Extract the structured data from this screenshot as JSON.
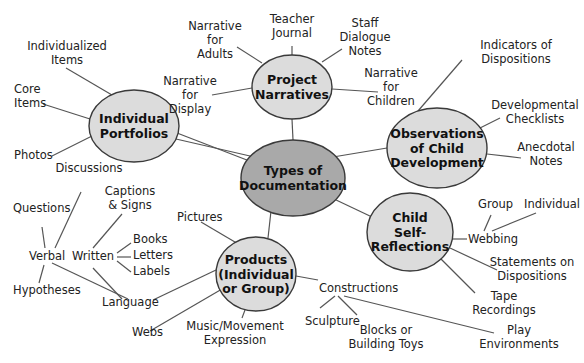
{
  "diagram": {
    "colors": {
      "center_fill": "#a9a9a9",
      "node_fill": "#dcdcdc",
      "stroke": "#3a3a3a",
      "edge": "#555555",
      "text": "#222222"
    },
    "center": {
      "id": "center",
      "lines": [
        "Types of",
        "Documentation"
      ],
      "cx": 293,
      "cy": 178,
      "rx": 52,
      "ry": 38
    },
    "nodes": [
      {
        "id": "individual-portfolios",
        "lines": [
          "Individual",
          "Portfolios"
        ],
        "cx": 134,
        "cy": 126,
        "rx": 45,
        "ry": 36
      },
      {
        "id": "project-narratives",
        "lines": [
          "Project",
          "Narratives"
        ],
        "cx": 292,
        "cy": 87,
        "rx": 40,
        "ry": 32
      },
      {
        "id": "observations-of-child-development",
        "lines": [
          "Observations",
          "of Child",
          "Development"
        ],
        "cx": 437,
        "cy": 148,
        "rx": 50,
        "ry": 40
      },
      {
        "id": "child-self-reflections",
        "lines": [
          "Child",
          "Self-",
          "Reflections"
        ],
        "cx": 410,
        "cy": 232,
        "rx": 43,
        "ry": 39
      },
      {
        "id": "products-individual-or-group",
        "lines": [
          "Products",
          "(Individual",
          "or Group)"
        ],
        "cx": 256,
        "cy": 274,
        "rx": 40,
        "ry": 37
      }
    ],
    "leaves": [
      {
        "id": "individualized-items",
        "lines": [
          "Individualized",
          "Items"
        ],
        "x": 67,
        "y": 50,
        "anchor": "middle"
      },
      {
        "id": "core-items",
        "lines": [
          "Core",
          "Items"
        ],
        "x": 14,
        "y": 93,
        "anchor": "start"
      },
      {
        "id": "photos",
        "lines": [
          "Photos"
        ],
        "x": 14,
        "y": 159,
        "anchor": "start"
      },
      {
        "id": "discussions",
        "lines": [
          "Discussions"
        ],
        "x": 89,
        "y": 172,
        "anchor": "middle"
      },
      {
        "id": "questions",
        "lines": [
          "Questions"
        ],
        "x": 13,
        "y": 212,
        "anchor": "start"
      },
      {
        "id": "verbal",
        "lines": [
          "Verbal"
        ],
        "x": 29,
        "y": 260,
        "anchor": "start"
      },
      {
        "id": "hypotheses",
        "lines": [
          "Hypotheses"
        ],
        "x": 13,
        "y": 294,
        "anchor": "start"
      },
      {
        "id": "captions-signs",
        "lines": [
          "Captions",
          "& Signs"
        ],
        "x": 130,
        "y": 195,
        "anchor": "middle"
      },
      {
        "id": "written",
        "lines": [
          "Written"
        ],
        "x": 72,
        "y": 260,
        "anchor": "start"
      },
      {
        "id": "books",
        "lines": [
          "Books"
        ],
        "x": 133,
        "y": 243,
        "anchor": "start"
      },
      {
        "id": "letters",
        "lines": [
          "Letters"
        ],
        "x": 133,
        "y": 259,
        "anchor": "start"
      },
      {
        "id": "labels",
        "lines": [
          "Labels"
        ],
        "x": 133,
        "y": 275,
        "anchor": "start"
      },
      {
        "id": "language",
        "lines": [
          "Language"
        ],
        "x": 102,
        "y": 306,
        "anchor": "start"
      },
      {
        "id": "webs",
        "lines": [
          "Webs"
        ],
        "x": 132,
        "y": 336,
        "anchor": "start"
      },
      {
        "id": "pictures",
        "lines": [
          "Pictures"
        ],
        "x": 177,
        "y": 221,
        "anchor": "start"
      },
      {
        "id": "music-movement-expression",
        "lines": [
          "Music/Movement",
          "Expression"
        ],
        "x": 235,
        "y": 330,
        "anchor": "middle"
      },
      {
        "id": "constructions",
        "lines": [
          "Constructions"
        ],
        "x": 319,
        "y": 292,
        "anchor": "start"
      },
      {
        "id": "sculpture",
        "lines": [
          "Sculpture"
        ],
        "x": 305,
        "y": 325,
        "anchor": "start"
      },
      {
        "id": "blocks-building-toys",
        "lines": [
          "Blocks or",
          "Building Toys"
        ],
        "x": 386,
        "y": 334,
        "anchor": "middle"
      },
      {
        "id": "play-environments",
        "lines": [
          "Play",
          "Environments"
        ],
        "x": 519,
        "y": 334,
        "anchor": "middle"
      },
      {
        "id": "narrative-for-adults",
        "lines": [
          "Narrative",
          "for",
          "Adults"
        ],
        "x": 215,
        "y": 30,
        "anchor": "middle"
      },
      {
        "id": "teacher-journal",
        "lines": [
          "Teacher",
          "Journal"
        ],
        "x": 292,
        "y": 23,
        "anchor": "middle"
      },
      {
        "id": "staff-dialogue-notes",
        "lines": [
          "Staff",
          "Dialogue",
          "Notes"
        ],
        "x": 365,
        "y": 27,
        "anchor": "middle"
      },
      {
        "id": "narrative-for-display",
        "lines": [
          "Narrative",
          "for",
          "Display"
        ],
        "x": 190,
        "y": 85,
        "anchor": "middle"
      },
      {
        "id": "narrative-for-children",
        "lines": [
          "Narrative",
          "for",
          "Children"
        ],
        "x": 391,
        "y": 77,
        "anchor": "middle"
      },
      {
        "id": "indicators-of-dispositions",
        "lines": [
          "Indicators of",
          "Dispositions"
        ],
        "x": 516,
        "y": 49,
        "anchor": "middle"
      },
      {
        "id": "developmental-checklists",
        "lines": [
          "Developmental",
          "Checklists"
        ],
        "x": 535,
        "y": 109,
        "anchor": "middle"
      },
      {
        "id": "anecdotal-notes",
        "lines": [
          "Anecdotal",
          "Notes"
        ],
        "x": 546,
        "y": 151,
        "anchor": "middle"
      },
      {
        "id": "group",
        "lines": [
          "Group"
        ],
        "x": 478,
        "y": 208,
        "anchor": "start"
      },
      {
        "id": "individual",
        "lines": [
          "Individual"
        ],
        "x": 524,
        "y": 208,
        "anchor": "start"
      },
      {
        "id": "webbing",
        "lines": [
          "Webbing"
        ],
        "x": 468,
        "y": 243,
        "anchor": "start"
      },
      {
        "id": "statements-on-dispositions",
        "lines": [
          "Statements on",
          "Dispositions"
        ],
        "x": 532,
        "y": 266,
        "anchor": "middle"
      },
      {
        "id": "tape-recordings",
        "lines": [
          "Tape",
          "Recordings"
        ],
        "x": 504,
        "y": 300,
        "anchor": "middle"
      }
    ],
    "edges": [
      [
        293,
        140,
        292,
        119
      ],
      [
        250,
        156,
        176,
        139
      ],
      [
        333,
        157,
        387,
        148
      ],
      [
        334,
        199,
        372,
        217
      ],
      [
        271,
        211,
        268,
        238
      ],
      [
        112,
        95,
        66,
        68
      ],
      [
        90,
        119,
        43,
        104
      ],
      [
        92,
        136,
        52,
        156
      ],
      [
        177,
        133,
        252,
        162
      ],
      [
        262,
        63,
        237,
        47
      ],
      [
        292,
        55,
        292,
        46
      ],
      [
        322,
        62,
        342,
        49
      ],
      [
        252,
        88,
        212,
        95
      ],
      [
        332,
        89,
        378,
        92
      ],
      [
        418,
        111,
        462,
        60
      ],
      [
        480,
        128,
        500,
        118
      ],
      [
        487,
        154,
        521,
        158
      ],
      [
        453,
        239,
        467,
        239
      ],
      [
        450,
        248,
        497,
        270
      ],
      [
        440,
        258,
        475,
        293
      ],
      [
        484,
        231,
        491,
        215
      ],
      [
        492,
        231,
        536,
        213
      ],
      [
        216,
        270,
        153,
        300
      ],
      [
        222,
        289,
        150,
        331
      ],
      [
        240,
        245,
        201,
        222
      ],
      [
        245,
        310,
        242,
        318
      ],
      [
        296,
        276,
        318,
        280
      ],
      [
        335,
        296,
        320,
        308
      ],
      [
        338,
        296,
        357,
        315
      ],
      [
        344,
        296,
        494,
        333
      ],
      [
        81,
        192,
        55,
        248
      ],
      [
        42,
        227,
        45,
        248
      ],
      [
        44,
        265,
        39,
        283
      ],
      [
        52,
        263,
        128,
        299
      ],
      [
        93,
        268,
        122,
        299
      ],
      [
        93,
        248,
        122,
        214
      ],
      [
        117,
        253,
        131,
        243
      ],
      [
        117,
        257,
        131,
        257
      ],
      [
        117,
        261,
        131,
        272
      ]
    ]
  }
}
